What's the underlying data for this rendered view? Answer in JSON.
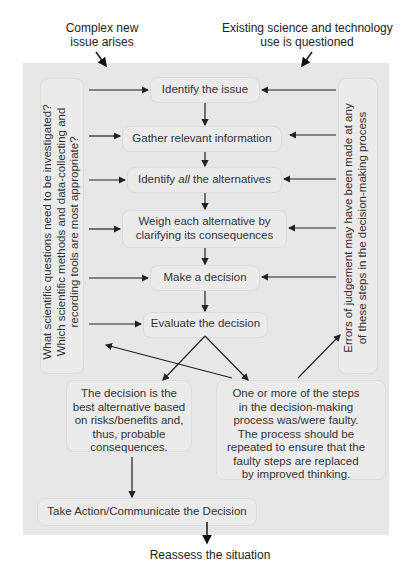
{
  "outside": {
    "top_left": [
      "Complex new",
      "issue arises"
    ],
    "top_right": [
      "Existing science and technology",
      "use is questioned"
    ],
    "bottom": "Reassess the situation"
  },
  "steps": [
    {
      "id": "identify",
      "label": "Identify the issue"
    },
    {
      "id": "gather",
      "label": "Gather relevant information"
    },
    {
      "id": "alternatives",
      "label_pre": "Identify ",
      "label_em": "all",
      "label_post": " the alternatives"
    },
    {
      "id": "weigh",
      "lines": [
        "Weigh each alternative by",
        "clarifying its consequences"
      ]
    },
    {
      "id": "decide",
      "label": "Make a decision"
    },
    {
      "id": "evaluate",
      "label": "Evaluate the decision"
    }
  ],
  "left_note": [
    "What scientific questions need to be investigated?",
    "Which scientific methods and data-collecting and",
    "recording tools are most appropriate?"
  ],
  "right_note": [
    "Errors of judgement may have been made at any",
    "of these steps in the decision-making process"
  ],
  "outcome_good": [
    "The decision is the",
    "best alternative based",
    "on risks/benefits and,",
    "thus, probable",
    "consequences."
  ],
  "outcome_bad": [
    "One or more of the steps",
    "in the decision-making",
    "process was/were faulty.",
    "The process should be",
    "repeated to ensure that the",
    "faulty steps are replaced",
    "by improved thinking."
  ],
  "action": "Take Action/Communicate the Decision",
  "colors": {
    "panel": "#e7e7e7",
    "box": "#ebebeb",
    "text": "#333333",
    "arrow": "#222222"
  }
}
